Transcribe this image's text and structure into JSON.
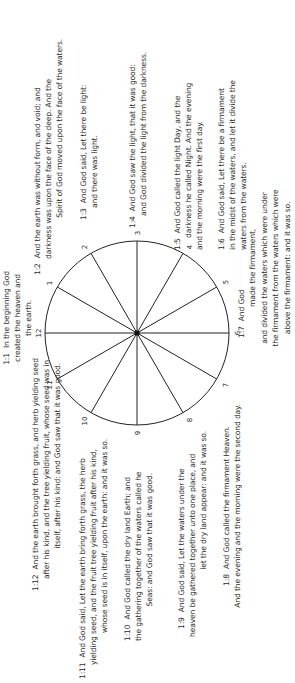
{
  "diagram": {
    "type": "clock-face",
    "center_label": "",
    "hour_labels": [
      "1",
      "2",
      "3",
      "4",
      "5",
      "6",
      "7",
      "8",
      "9",
      "10",
      "11",
      "12"
    ],
    "stroke_color": "#222222"
  },
  "verses": {
    "v1": {
      "ref": "1:1",
      "lines": [
        "In the beginning God",
        "created the heaven and",
        "the earth."
      ]
    },
    "v2": {
      "ref": "1:2",
      "lines": [
        "And the earth was without form, and void; and",
        "darkness was upon the face of the deep. And the",
        "Spirit of God moved upon the face of the waters."
      ]
    },
    "v3": {
      "ref": "1:3",
      "lines": [
        "And God said, Let there be light:",
        "and there was light."
      ]
    },
    "v4": {
      "ref": "1:4",
      "lines": [
        "And God saw the light, that it was good:",
        "and God divided the light from the darkness."
      ]
    },
    "v5": {
      "ref": "1:5",
      "lines": [
        "And God called the light Day, and the",
        "darkness he called Night. And the evening",
        "and the morning were the first day."
      ]
    },
    "v6": {
      "ref": "1:6",
      "lines": [
        "And God said, Let there be a firmament",
        "in the midst of the waters, and let it divide the",
        "waters from the waters."
      ]
    },
    "v7": {
      "ref": "1:7",
      "lines": [
        "And God",
        "made the firmament,",
        "and divided the waters which were under",
        "the firmament from the waters which were",
        "above the firmament: and it was so."
      ]
    },
    "v8": {
      "ref": "1:8",
      "lines": [
        "And God called the firmament Heaven.",
        "And the evening and the morning were the second day."
      ]
    },
    "v9": {
      "ref": "1:9",
      "lines": [
        "And God said, Let the waters under the",
        "heaven be gathered together unto one place, and",
        "let the dry land appear: and it was so."
      ]
    },
    "v10": {
      "ref": "1:10",
      "lines": [
        "And God called the dry land Earth; and",
        "the gathering together of the waters called he",
        "Seas: and God saw that it was good."
      ]
    },
    "v11": {
      "ref": "1:11",
      "lines": [
        "And God said, Let the earth bring forth grass, the herb",
        "yielding seed, and the fruit tree yielding fruit after his kind,",
        "whose seed is in itself, upon the earth: and it was so."
      ]
    },
    "v12": {
      "ref": "1:12",
      "lines": [
        "And the earth brought forth grass, and herb yielding seed",
        "after his kind, and the tree yielding fruit, whose seed was in",
        "itself, after his kind: and God saw that it was good."
      ]
    }
  }
}
